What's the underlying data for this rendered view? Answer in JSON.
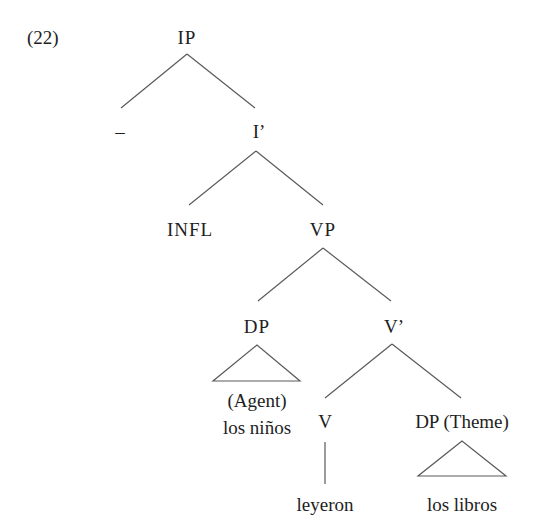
{
  "example_number": "(22)",
  "tree": {
    "root": {
      "label": "IP",
      "children": [
        {
          "label": "–"
        },
        {
          "label": "I’",
          "children": [
            {
              "label": "INFL"
            },
            {
              "label": "VP",
              "children": [
                {
                  "label": "DP",
                  "triangle": true,
                  "role": "(Agent)",
                  "terminal": "los niños"
                },
                {
                  "label": "V’",
                  "children": [
                    {
                      "label": "V",
                      "terminal": "leyeron"
                    },
                    {
                      "label": "DP (Theme)",
                      "triangle": true,
                      "terminal": "los libros"
                    }
                  ]
                }
              ]
            }
          ]
        }
      ]
    }
  },
  "nodes": {
    "ip": "IP",
    "spec_ip": "–",
    "i_bar": "I’",
    "infl": "INFL",
    "vp": "VP",
    "dp_agent": "DP",
    "agent_role": "(Agent)",
    "agent_terminal": "los niños",
    "v_bar": "V’",
    "v": "V",
    "v_terminal": "leyeron",
    "dp_theme": "DP (Theme)",
    "theme_terminal": "los libros"
  },
  "colors": {
    "text": "#1e1e1e",
    "lines": "#5a5a5a",
    "background": "#ffffff"
  }
}
